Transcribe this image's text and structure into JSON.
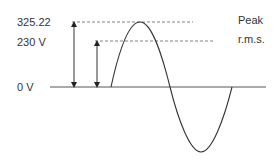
{
  "labels": {
    "peak_value": "325.22",
    "rms_value": "230 V",
    "zero": "0 V",
    "peak_caption": "Peak",
    "rms_caption": "r.m.s."
  },
  "colors": {
    "line": "#333333",
    "dashed": "#555555",
    "axis": "#555555"
  }
}
